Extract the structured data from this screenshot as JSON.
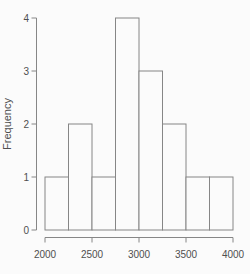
{
  "chart_data": {
    "type": "bar",
    "subtype": "histogram",
    "title": "",
    "xlabel": "",
    "ylabel": "Frequency",
    "bin_edges": [
      2000,
      2250,
      2500,
      2750,
      3000,
      3250,
      3500,
      3750,
      4000
    ],
    "values": [
      1,
      2,
      1,
      4,
      3,
      2,
      1,
      1
    ],
    "x_ticks": [
      2000,
      2500,
      3000,
      3500,
      4000
    ],
    "x_tick_labels": [
      "2000",
      "2500",
      "3000",
      "3500",
      "4000"
    ],
    "y_ticks": [
      0,
      1,
      2,
      3,
      4
    ],
    "y_tick_labels": [
      "0",
      "1",
      "2",
      "3",
      "4"
    ],
    "xlim": [
      2000,
      4000
    ],
    "ylim": [
      0,
      4
    ],
    "grid": false,
    "legend": "none",
    "colors": {
      "background": "#fbfbfb",
      "bar_fill": "#fbfbfb",
      "stroke": "#868686",
      "text": "#4f4f4f"
    }
  }
}
